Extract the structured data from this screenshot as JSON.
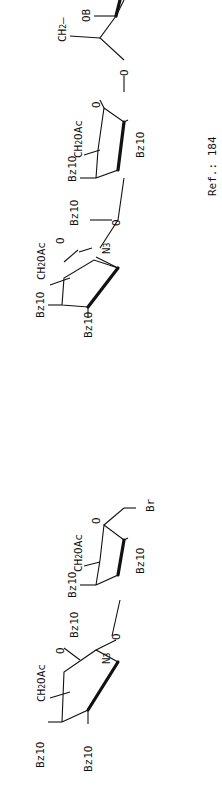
{
  "diagram": {
    "type": "chemical-structure",
    "orientation": "rotated-90-ccw",
    "compound_1": {
      "name": "disaccharide glycosyl bromide",
      "units": [
        {
          "id": "ring-a",
          "substituents": [
            "Bz1O",
            "Bz1O",
            "CH2OAc",
            "N3",
            "O"
          ]
        },
        {
          "id": "ring-b",
          "substituents": [
            "Bz1O",
            "CH2OAc",
            "Bz1O",
            "Br",
            "O"
          ]
        }
      ],
      "linkage": "O"
    },
    "compound_2": {
      "name": "trisaccharide fragment",
      "units": [
        {
          "id": "ring-c",
          "substituents": [
            "Bz1O",
            "Bz1O",
            "CH2OAc",
            "N3",
            "O"
          ]
        },
        {
          "id": "ring-d",
          "substituents": [
            "Bz1O",
            "CH2OAc",
            "Bz1O",
            "O"
          ]
        },
        {
          "id": "ring-e",
          "substituents": [
            "CH2",
            "OB"
          ]
        }
      ],
      "linkages": [
        "O",
        "O"
      ]
    },
    "labels": {
      "bz1o": "Bz1O",
      "ch2": "CH",
      "two": "2",
      "oac": "OAc",
      "n": "N",
      "three": "3",
      "o": "O",
      "br": "Br",
      "ch2_dash": "CH",
      "ob": "OB",
      "dash": "–"
    },
    "reference": "Ref.: 184"
  }
}
